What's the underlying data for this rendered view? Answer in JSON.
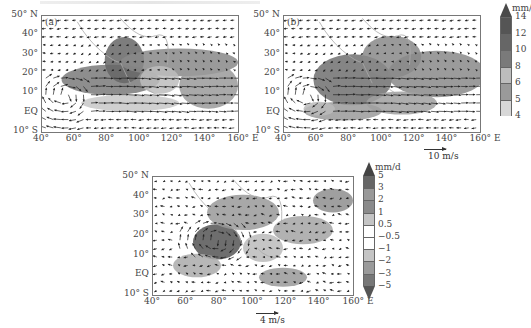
{
  "figure": {
    "panels": [
      {
        "id": "a",
        "label": "(a)",
        "lat_ticks": [
          "50° N",
          "40°",
          "30°",
          "20°",
          "10°",
          "EQ",
          "10° S"
        ],
        "lon_ticks": [
          "40°",
          "60°",
          "80°",
          "100°",
          "120°",
          "140°",
          "160° E"
        ]
      },
      {
        "id": "b",
        "label": "(b)",
        "lat_ticks": [
          "50° N",
          "40°",
          "30°",
          "20°",
          "10°",
          "EQ",
          "10° S"
        ],
        "lon_ticks": [
          "40°",
          "60°",
          "80°",
          "100°",
          "120°",
          "140°",
          "160° E"
        ],
        "ref_vector": "10 m/s"
      },
      {
        "id": "c",
        "label": "",
        "lat_ticks": [
          "50° N",
          "40°",
          "30°",
          "20°",
          "10°",
          "EQ",
          "10° S"
        ],
        "lon_ticks": [
          "40°",
          "60°",
          "80°",
          "100°",
          "120°",
          "140°",
          "160° E"
        ],
        "ref_vector": "4 m/s"
      }
    ],
    "colorbar_top": {
      "unit": "mm/d",
      "levels": [
        "14",
        "12",
        "10",
        "8",
        "6",
        "5",
        "4"
      ]
    },
    "colorbar_bottom": {
      "unit": "mm/d",
      "levels": [
        "5",
        "3",
        "2",
        "1",
        "0.5",
        "−0.5",
        "−1",
        "−2",
        "−3",
        "−5"
      ]
    }
  },
  "chart_data": [
    {
      "type": "heatmap",
      "title": "(a) Wind vectors and precipitation",
      "xlabel": "Longitude",
      "ylabel": "Latitude",
      "xlim": [
        "40°E",
        "160°E"
      ],
      "ylim": [
        "10°S",
        "50°N"
      ],
      "x_ticks": [
        "40°",
        "60°",
        "80°",
        "100°",
        "120°",
        "140°",
        "160° E"
      ],
      "y_ticks": [
        "50° N",
        "40°",
        "30°",
        "20°",
        "10°",
        "EQ",
        "10° S"
      ],
      "overlay": "wind vectors",
      "shading_units": "mm/d",
      "shading_levels": [
        4,
        5,
        6,
        8,
        10,
        12,
        14
      ],
      "notes": "Heavy precipitation (>10 mm/d) over Bay of Bengal/Indochina 5-25°N, 70-110°E and along 20-30°N East Asia band; strong westerly monsoon flow across Arabian Sea to Philippines."
    },
    {
      "type": "heatmap",
      "title": "(b) Wind vectors and precipitation",
      "xlabel": "Longitude",
      "ylabel": "Latitude",
      "xlim": [
        "40°E",
        "160°E"
      ],
      "ylim": [
        "10°S",
        "50°N"
      ],
      "x_ticks": [
        "40°",
        "60°",
        "80°",
        "100°",
        "120°",
        "140°",
        "160° E"
      ],
      "y_ticks": [
        "50° N",
        "40°",
        "30°",
        "20°",
        "10°",
        "EQ",
        "10° S"
      ],
      "overlay": "wind vectors",
      "reference_vector": "10 m/s",
      "shading_units": "mm/d",
      "shading_levels": [
        4,
        5,
        6,
        8,
        10,
        12,
        14
      ],
      "notes": "Precipitation maxima over 70-100°E, 5-25°N and western Pacific 120-160°E; equatorial Indian Ocean band near EQ-5°S."
    },
    {
      "type": "heatmap",
      "title": "Difference: wind vectors and precipitation",
      "xlabel": "Longitude",
      "ylabel": "Latitude",
      "xlim": [
        "40°E",
        "160°E"
      ],
      "ylim": [
        "10°S",
        "50°N"
      ],
      "x_ticks": [
        "40°",
        "60°",
        "80°",
        "100°",
        "120°",
        "140°",
        "160° E"
      ],
      "y_ticks": [
        "50° N",
        "40°",
        "30°",
        "20°",
        "10°",
        "EQ",
        "10° S"
      ],
      "overlay": "wind vector differences",
      "reference_vector": "4 m/s",
      "shading_units": "mm/d",
      "shading_levels": [
        -5,
        -3,
        -2,
        -1,
        -0.5,
        0.5,
        1,
        2,
        3,
        5
      ],
      "notes": "Positive differences over Bay of Bengal ~75-95°E, 10-20°N and parts of Tibetan Plateau; cyclonic circulation anomaly near 80°E,15°N; mixed positive/negative over western Pacific."
    }
  ]
}
